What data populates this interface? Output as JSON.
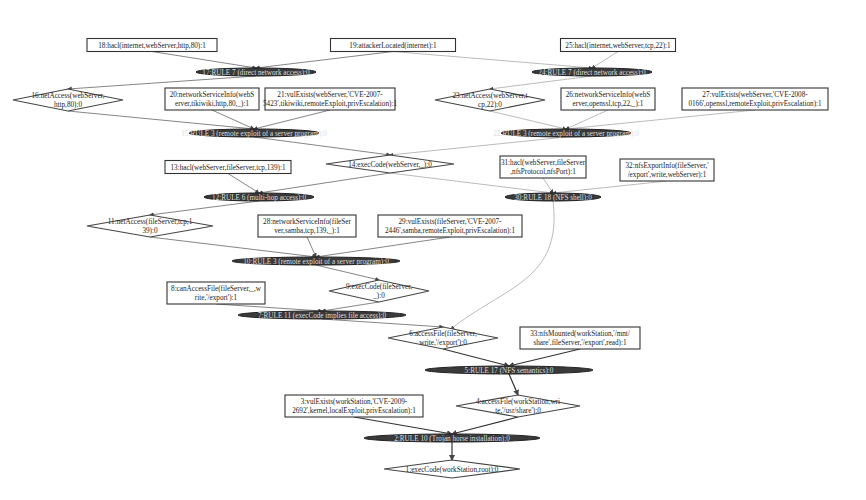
{
  "diagram": {
    "type": "attack-graph",
    "nodes": [
      {
        "id": "18",
        "kind": "leaf",
        "label": "18:hacl(internet,webServer,http,80):1",
        "x": 152,
        "y": 45,
        "w": 130,
        "h": 13
      },
      {
        "id": "19",
        "kind": "leaf",
        "label": "19:attackerLocated(internet):1",
        "x": 393,
        "y": 45,
        "w": 125,
        "h": 13
      },
      {
        "id": "25",
        "kind": "leaf",
        "label": "25:hacl(internet,webServer,tcp,22):1",
        "x": 618,
        "y": 45,
        "w": 115,
        "h": 13
      },
      {
        "id": "rule7a",
        "kind": "rule",
        "label": "17:RULE 7 (direct network access):0",
        "x": 256,
        "y": 72,
        "w": 120,
        "h": 8
      },
      {
        "id": "rule7b",
        "kind": "rule",
        "label": "24:RULE 7 (direct network access):0",
        "x": 592,
        "y": 72,
        "w": 120,
        "h": 8
      },
      {
        "id": "16",
        "kind": "derived",
        "label": [
          "16:netAccess(webServer,",
          "http,80):0"
        ],
        "x": 68,
        "y": 100,
        "w": 110,
        "h": 22
      },
      {
        "id": "20",
        "kind": "leaf",
        "label": [
          "20:networkServiceInfo(webS",
          "erver,tikiwiki,http,80,_):1"
        ],
        "x": 212,
        "y": 99,
        "w": 94,
        "h": 22
      },
      {
        "id": "21",
        "kind": "leaf",
        "label": [
          "21:vulExists(webServer,'CVE-2007-",
          "5423',tikiwiki,remoteExploit,privEscalation):1"
        ],
        "x": 330,
        "y": 99,
        "w": 130,
        "h": 22
      },
      {
        "id": "23",
        "kind": "derived",
        "label": [
          "23:netAccess(webServer,t",
          "cp,22):0"
        ],
        "x": 490,
        "y": 100,
        "w": 110,
        "h": 22
      },
      {
        "id": "26",
        "kind": "leaf",
        "label": [
          "26:networkServiceInfo(webS",
          "erver,openssl,tcp,22,_):1"
        ],
        "x": 608,
        "y": 99,
        "w": 94,
        "h": 22
      },
      {
        "id": "27",
        "kind": "leaf",
        "label": [
          "27:vulExists(webServer,'CVE-2008-",
          "0166',openssl,remoteExploit,privEscalation):1"
        ],
        "x": 755,
        "y": 99,
        "w": 146,
        "h": 22
      },
      {
        "id": "rule3a",
        "kind": "rule",
        "label": "15:RULE 3 (remote exploit of a server program):0",
        "x": 254,
        "y": 133,
        "w": 130,
        "h": 8
      },
      {
        "id": "rule3b",
        "kind": "rule",
        "label": "22:RULE 3 (remote exploit of a server program):0",
        "x": 566,
        "y": 133,
        "w": 130,
        "h": 8
      },
      {
        "id": "13",
        "kind": "leaf",
        "label": "13:hacl(webServer,fileServer,tcp,139):1",
        "x": 228,
        "y": 167,
        "w": 126,
        "h": 13
      },
      {
        "id": "14",
        "kind": "derived",
        "label": "14:execCode(webServer,_):0",
        "x": 390,
        "y": 164,
        "w": 128,
        "h": 18
      },
      {
        "id": "31",
        "kind": "leaf",
        "label": [
          "31:hacl(webServer,fileServer",
          ",nfsProtocol,nfsPort):1"
        ],
        "x": 543,
        "y": 167,
        "w": 86,
        "h": 22
      },
      {
        "id": "32",
        "kind": "leaf",
        "label": [
          "32:nfsExportInfo(fileServer,'",
          "/export',write,webServer):1"
        ],
        "x": 667,
        "y": 170,
        "w": 94,
        "h": 22
      },
      {
        "id": "rule6",
        "kind": "rule",
        "label": "12:RULE 6 (multi-hop access):0",
        "x": 259,
        "y": 197,
        "w": 110,
        "h": 8
      },
      {
        "id": "rule18",
        "kind": "rule",
        "label": "30:RULE 18 (NFS shell):0",
        "x": 553,
        "y": 197,
        "w": 96,
        "h": 8
      },
      {
        "id": "11",
        "kind": "derived",
        "label": [
          "11:netAccess(fileServer,tcp,1",
          "39):0"
        ],
        "x": 150,
        "y": 226,
        "w": 126,
        "h": 22
      },
      {
        "id": "28",
        "kind": "leaf",
        "label": [
          "28:networkServiceInfo(fileSer",
          "ver,samba,tcp,139,_):1"
        ],
        "x": 307,
        "y": 226,
        "w": 98,
        "h": 22
      },
      {
        "id": "29",
        "kind": "leaf",
        "label": [
          "29:vulExists(fileServer,'CVE-2007-",
          "2446',samba,remoteExploit,privEscalation):1"
        ],
        "x": 450,
        "y": 226,
        "w": 144,
        "h": 22
      },
      {
        "id": "rule3c",
        "kind": "rule",
        "label": "10:RULE 3 (remote exploit of a server program):0",
        "x": 316,
        "y": 261,
        "w": 168,
        "h": 8
      },
      {
        "id": "8",
        "kind": "leaf",
        "label": [
          "8:canAccessFile(fileServer,_,w",
          "rite,'/export'):1"
        ],
        "x": 216,
        "y": 293,
        "w": 98,
        "h": 22
      },
      {
        "id": "9",
        "kind": "derived",
        "label": [
          "9:execCode(fileServer,",
          "_):0"
        ],
        "x": 379,
        "y": 291,
        "w": 100,
        "h": 22
      },
      {
        "id": "rule11",
        "kind": "rule",
        "label": "7:RULE 11 (execCode implies file access):0",
        "x": 322,
        "y": 315,
        "w": 168,
        "h": 8
      },
      {
        "id": "6",
        "kind": "derived",
        "label": [
          "6:accessFile(fileServer,",
          "write,'/export'):0"
        ],
        "x": 443,
        "y": 338,
        "w": 110,
        "h": 22
      },
      {
        "id": "33",
        "kind": "leaf",
        "label": [
          "33:nfsMounted(workStation,'/mnt/",
          "share',fileServer,'/export',read):1"
        ],
        "x": 580,
        "y": 338,
        "w": 120,
        "h": 22
      },
      {
        "id": "rule17",
        "kind": "rule",
        "label": "5:RULE 17 (NFS semantics):0",
        "x": 509,
        "y": 370,
        "w": 168,
        "h": 8
      },
      {
        "id": "3",
        "kind": "leaf",
        "label": [
          "3:vulExists(workStation,'CVE-2009-",
          "2692',kernel,localExploit,privEscalation):1"
        ],
        "x": 354,
        "y": 406,
        "w": 138,
        "h": 22
      },
      {
        "id": "4",
        "kind": "derived",
        "label": [
          "4:accessFile(workStation,wri",
          "te,'/usr/share'):0"
        ],
        "x": 518,
        "y": 406,
        "w": 124,
        "h": 22
      },
      {
        "id": "rule10",
        "kind": "rule",
        "label": "2:RULE 10 (Trojan horse installation):0",
        "x": 452,
        "y": 438,
        "w": 176,
        "h": 8
      },
      {
        "id": "1",
        "kind": "derived",
        "label": "1:execCode(workStation,root):0",
        "x": 452,
        "y": 469,
        "w": 136,
        "h": 18
      }
    ],
    "edges": [
      {
        "from": "18",
        "to": "rule7a",
        "style": "normal"
      },
      {
        "from": "19",
        "to": "rule7a",
        "style": "normal"
      },
      {
        "from": "19",
        "to": "rule7b",
        "style": "light"
      },
      {
        "from": "25",
        "to": "rule7b",
        "style": "light"
      },
      {
        "from": "rule7a",
        "to": "16",
        "style": "normal"
      },
      {
        "from": "rule7b",
        "to": "23",
        "style": "light"
      },
      {
        "from": "16",
        "to": "rule3a",
        "style": "normal"
      },
      {
        "from": "20",
        "to": "rule3a",
        "style": "normal"
      },
      {
        "from": "21",
        "to": "rule3a",
        "style": "normal"
      },
      {
        "from": "23",
        "to": "rule3b",
        "style": "light"
      },
      {
        "from": "26",
        "to": "rule3b",
        "style": "light"
      },
      {
        "from": "27",
        "to": "rule3b",
        "style": "light"
      },
      {
        "from": "rule3a",
        "to": "14",
        "style": "normal"
      },
      {
        "from": "rule3b",
        "to": "14",
        "style": "light"
      },
      {
        "from": "13",
        "to": "rule6",
        "style": "normal"
      },
      {
        "from": "14",
        "to": "rule6",
        "style": "normal"
      },
      {
        "from": "14",
        "to": "rule18",
        "style": "light"
      },
      {
        "from": "31",
        "to": "rule18",
        "style": "light"
      },
      {
        "from": "32",
        "to": "rule18",
        "style": "light"
      },
      {
        "from": "rule6",
        "to": "11",
        "style": "normal"
      },
      {
        "from": "11",
        "to": "rule3c",
        "style": "normal"
      },
      {
        "from": "28",
        "to": "rule3c",
        "style": "normal"
      },
      {
        "from": "29",
        "to": "rule3c",
        "style": "normal"
      },
      {
        "from": "rule3c",
        "to": "9",
        "style": "normal"
      },
      {
        "from": "8",
        "to": "rule11",
        "style": "normal"
      },
      {
        "from": "9",
        "to": "rule11",
        "style": "normal"
      },
      {
        "from": "rule11",
        "to": "6",
        "style": "normal"
      },
      {
        "from": "rule18",
        "to": "6",
        "style": "curve"
      },
      {
        "from": "6",
        "to": "rule17",
        "style": "dark"
      },
      {
        "from": "33",
        "to": "rule17",
        "style": "dark"
      },
      {
        "from": "rule17",
        "to": "4",
        "style": "dark"
      },
      {
        "from": "3",
        "to": "rule10",
        "style": "dark"
      },
      {
        "from": "4",
        "to": "rule10",
        "style": "dark"
      },
      {
        "from": "rule10",
        "to": "1",
        "style": "dark"
      }
    ]
  }
}
